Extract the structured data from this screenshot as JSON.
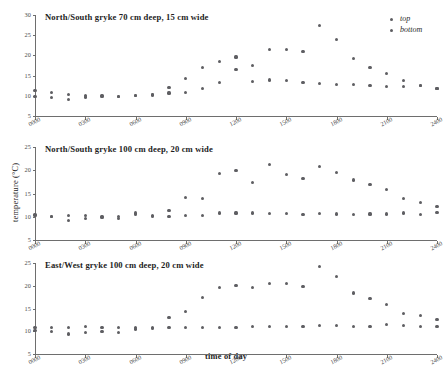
{
  "figure": {
    "ylabel": "temperature (°C)",
    "xlabel": "time of day",
    "legend": [
      {
        "key": "top",
        "label": "top"
      },
      {
        "key": "bottom",
        "label": "bottom"
      }
    ],
    "marker_color": "#5e5e62",
    "axis_color": "#6e6e6e"
  },
  "chart_data": [
    {
      "type": "scatter",
      "title": "North/South gryke 70 cm deep, 15 cm wide",
      "xlabel": "",
      "ylabel": "temperature (°C)",
      "xlim": [
        0,
        2400
      ],
      "ylim": [
        5,
        30
      ],
      "yticks": [
        5,
        10,
        15,
        20,
        25,
        30
      ],
      "xticks": [
        0,
        300,
        600,
        900,
        1200,
        1500,
        1800,
        2100,
        2400
      ],
      "xticklabels": [
        "0000",
        "0300",
        "0600",
        "0900",
        "1200",
        "1500",
        "1800",
        "2100",
        "2400"
      ],
      "grid": false,
      "legend_position": "top-right",
      "x": [
        0,
        100,
        200,
        300,
        400,
        500,
        600,
        700,
        800,
        900,
        1000,
        1100,
        1200,
        1300,
        1400,
        1500,
        1600,
        1700,
        1800,
        1900,
        2000,
        2100,
        2200,
        2300,
        2400
      ],
      "series": [
        {
          "name": "top",
          "values": [
            11.4,
            10.9,
            10.4,
            10.1,
            10.1,
            9.9,
            10.1,
            10.4,
            12.1,
            14.2,
            17.1,
            18.6,
            19.6,
            17.5,
            21.5,
            21.4,
            20.9,
            27.3,
            23.9,
            19.2,
            16.9,
            15.6,
            13.8,
            12.5,
            11.7
          ]
        },
        {
          "name": "bottom",
          "values": [
            9.8,
            9.6,
            9.1,
            9.7,
            9.9,
            9.8,
            10.0,
            10.2,
            10.7,
            10.9,
            11.8,
            13.3,
            16.4,
            13.6,
            13.9,
            13.8,
            13.3,
            13.0,
            12.9,
            12.8,
            12.5,
            12.3,
            12.4,
            12.5,
            11.7
          ]
        }
      ]
    },
    {
      "type": "scatter",
      "title": "North/South gryke 100 cm deep, 20 cm wide",
      "xlabel": "",
      "ylabel": "temperature (°C)",
      "xlim": [
        0,
        2400
      ],
      "ylim": [
        5,
        25
      ],
      "yticks": [
        5,
        10,
        15,
        20,
        25
      ],
      "xticks": [
        0,
        300,
        600,
        900,
        1200,
        1500,
        1800,
        2100,
        2400
      ],
      "xticklabels": [
        "0000",
        "0300",
        "0600",
        "0900",
        "1200",
        "1500",
        "1800",
        "2100",
        "2400"
      ],
      "grid": false,
      "legend_position": "none",
      "x": [
        0,
        100,
        200,
        300,
        400,
        500,
        600,
        700,
        800,
        900,
        1000,
        1100,
        1200,
        1300,
        1400,
        1500,
        1600,
        1700,
        1800,
        1900,
        2000,
        2100,
        2200,
        2300,
        2400
      ],
      "series": [
        {
          "name": "top",
          "values": [
            10.4,
            10.1,
            10.3,
            10.2,
            10.1,
            10.1,
            10.8,
            10.2,
            11.4,
            14.2,
            14.0,
            19.3,
            19.9,
            17.3,
            21.3,
            19.1,
            18.3,
            20.8,
            19.5,
            17.9,
            16.9,
            15.8,
            13.9,
            13.0,
            12.2
          ]
        },
        {
          "name": "bottom",
          "values": [
            10.2,
            10.0,
            9.2,
            9.7,
            9.8,
            9.7,
            10.5,
            10.0,
            10.0,
            10.2,
            10.2,
            10.8,
            10.8,
            10.8,
            10.7,
            10.7,
            10.5,
            10.7,
            10.6,
            10.5,
            10.6,
            10.6,
            10.8,
            10.5,
            10.9
          ]
        }
      ]
    },
    {
      "type": "scatter",
      "title": "East/West gryke 100 cm deep, 20 cm wide",
      "xlabel": "time of day",
      "ylabel": "temperature (°C)",
      "xlim": [
        0,
        2400
      ],
      "ylim": [
        5,
        25
      ],
      "yticks": [
        5,
        10,
        15,
        20,
        25
      ],
      "xticks": [
        0,
        300,
        600,
        900,
        1200,
        1500,
        1800,
        2100,
        2400
      ],
      "xticklabels": [
        "0000",
        "0300",
        "0600",
        "0900",
        "1200",
        "1500",
        "1800",
        "2100",
        "2400"
      ],
      "grid": false,
      "legend_position": "none",
      "x": [
        0,
        100,
        200,
        300,
        400,
        500,
        600,
        700,
        800,
        900,
        1000,
        1100,
        1200,
        1300,
        1400,
        1500,
        1600,
        1700,
        1800,
        1900,
        2000,
        2100,
        2200,
        2300,
        2400
      ],
      "series": [
        {
          "name": "top",
          "values": [
            10.9,
            10.9,
            10.9,
            11.1,
            10.9,
            10.8,
            10.9,
            10.8,
            13.0,
            14.4,
            17.5,
            19.7,
            20.0,
            19.7,
            20.5,
            20.4,
            19.9,
            24.3,
            22.1,
            18.4,
            17.2,
            15.9,
            13.9,
            13.4,
            12.6
          ]
        },
        {
          "name": "bottom",
          "values": [
            10.1,
            9.9,
            9.4,
            9.8,
            10.0,
            9.8,
            10.5,
            10.7,
            10.9,
            10.9,
            10.9,
            10.9,
            10.8,
            11.0,
            11.0,
            11.1,
            11.1,
            11.2,
            11.2,
            11.0,
            11.0,
            11.4,
            11.2,
            11.0,
            11.1
          ]
        }
      ]
    }
  ]
}
